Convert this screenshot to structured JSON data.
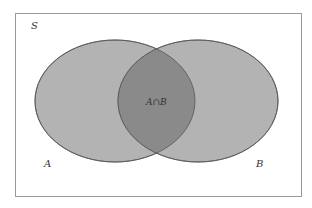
{
  "diagram": {
    "type": "venn",
    "universe_label": "S",
    "sets": [
      {
        "label": "A",
        "fill": "#b3b3b3"
      },
      {
        "label": "B",
        "fill": "#b3b3b3"
      }
    ],
    "intersection_label": "A∩B",
    "intersection_fill": "#8a8a8a",
    "border_color": "#999999"
  }
}
